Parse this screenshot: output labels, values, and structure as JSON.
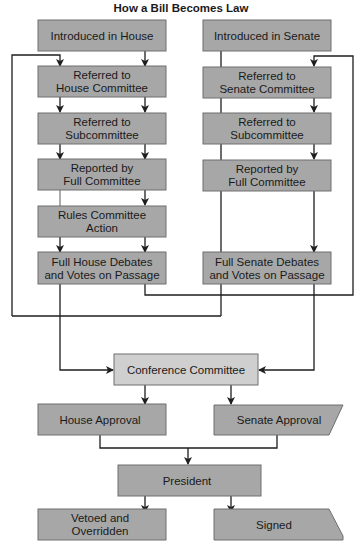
{
  "title": "How a Bill Becomes Law",
  "colors": {
    "box_fill": "#a7a7a7",
    "conference_fill": "#cfcfcf",
    "box_stroke": "#6f6f6f",
    "line": "#1e1e1e"
  },
  "house": {
    "introduced": "Introduced in House",
    "committee": [
      "Referred to",
      "House Committee"
    ],
    "subcommittee": [
      "Referred to",
      "Subcommittee"
    ],
    "reported": [
      "Reported by",
      "Full Committee"
    ],
    "rules": [
      "Rules Committee",
      "Action"
    ],
    "floor": [
      "Full House Debates",
      "and Votes on Passage"
    ]
  },
  "senate": {
    "introduced": "Introduced in Senate",
    "committee": [
      "Referred to",
      "Senate Committee"
    ],
    "subcommittee": [
      "Referred to",
      "Subcommittee"
    ],
    "reported": [
      "Reported by",
      "Full Committee"
    ],
    "floor": [
      "Full Senate Debates",
      "and Votes on Passage"
    ]
  },
  "conference": "Conference Committee",
  "house_approval": "House Approval",
  "senate_approval": "Senate Approval",
  "president": "President",
  "vetoed": [
    "Vetoed and",
    "Overridden"
  ],
  "signed": "Signed"
}
